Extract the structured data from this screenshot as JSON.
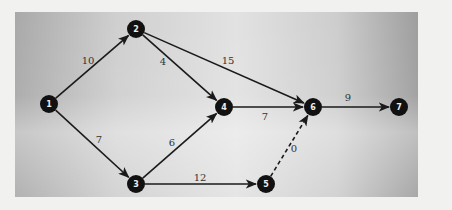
{
  "diagram": {
    "type": "network",
    "title": "",
    "nodes": [
      {
        "id": "1",
        "label": "1",
        "x": 49,
        "y": 104
      },
      {
        "id": "2",
        "label": "2",
        "x": 136,
        "y": 29
      },
      {
        "id": "3",
        "label": "3",
        "x": 136,
        "y": 184
      },
      {
        "id": "4",
        "label": "4",
        "x": 224,
        "y": 107
      },
      {
        "id": "5",
        "label": "5",
        "x": 266,
        "y": 184
      },
      {
        "id": "6",
        "label": "6",
        "x": 313,
        "y": 107
      },
      {
        "id": "7",
        "label": "7",
        "x": 399,
        "y": 107
      }
    ],
    "edges": [
      {
        "from": "1",
        "to": "2",
        "weight": "10",
        "style": "solid",
        "lx": 88,
        "ly": 64
      },
      {
        "from": "1",
        "to": "3",
        "weight": "7",
        "style": "solid",
        "lx": 99,
        "ly": 143
      },
      {
        "from": "2",
        "to": "4",
        "weight": "4",
        "style": "solid",
        "lx": 163,
        "ly": 65
      },
      {
        "from": "2",
        "to": "6",
        "weight": "15",
        "style": "solid",
        "lx": 228,
        "ly": 64
      },
      {
        "from": "3",
        "to": "4",
        "weight": "6",
        "style": "solid",
        "lx": 172,
        "ly": 146
      },
      {
        "from": "3",
        "to": "5",
        "weight": "12",
        "style": "solid",
        "lx": 200,
        "ly": 181
      },
      {
        "from": "4",
        "to": "6",
        "weight": "7",
        "style": "solid",
        "lx": 265,
        "ly": 120
      },
      {
        "from": "5",
        "to": "6",
        "weight": "0",
        "style": "dashed",
        "lx": 294,
        "ly": 152
      },
      {
        "from": "6",
        "to": "7",
        "weight": "9",
        "style": "solid",
        "lx": 348,
        "ly": 101
      }
    ]
  }
}
